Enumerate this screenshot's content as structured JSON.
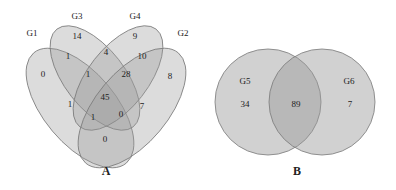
{
  "panels": [
    {
      "id": "A",
      "label": "A",
      "type": "venn-4-set",
      "sets": [
        "G1",
        "G2",
        "G3",
        "G4"
      ],
      "regions": [
        {
          "sets": [
            "G3"
          ],
          "value": "14"
        },
        {
          "sets": [
            "G4"
          ],
          "value": "9"
        },
        {
          "sets": [
            "G1"
          ],
          "value": "0"
        },
        {
          "sets": [
            "G2"
          ],
          "value": "8"
        },
        {
          "sets": [
            "G1",
            "G3"
          ],
          "value": "1"
        },
        {
          "sets": [
            "G3",
            "G4"
          ],
          "value": "4"
        },
        {
          "sets": [
            "G2",
            "G4"
          ],
          "value": "10"
        },
        {
          "sets": [
            "G1",
            "G3",
            "G4"
          ],
          "value": "1"
        },
        {
          "sets": [
            "G2",
            "G3",
            "G4"
          ],
          "value": "28"
        },
        {
          "sets": [
            "G1",
            "G2",
            "G3",
            "G4"
          ],
          "value": "45"
        },
        {
          "sets": [
            "G1",
            "G4"
          ],
          "value": "1"
        },
        {
          "sets": [
            "G2",
            "G3"
          ],
          "value": "7"
        },
        {
          "sets": [
            "G1",
            "G2",
            "G4"
          ],
          "value": "1"
        },
        {
          "sets": [
            "G1",
            "G2",
            "G3"
          ],
          "value": "0"
        },
        {
          "sets": [
            "G1",
            "G2"
          ],
          "value": "0"
        }
      ]
    },
    {
      "id": "B",
      "label": "B",
      "type": "venn-2-set",
      "sets": [
        "G5",
        "G6"
      ],
      "regions": [
        {
          "sets": [
            "G5"
          ],
          "value": "34"
        },
        {
          "sets": [
            "G5",
            "G6"
          ],
          "value": "89"
        },
        {
          "sets": [
            "G6"
          ],
          "value": "7"
        }
      ]
    }
  ],
  "colors": {
    "fill": "#9a9a9a",
    "stroke": "#7a7a7a",
    "text": "#222222"
  }
}
